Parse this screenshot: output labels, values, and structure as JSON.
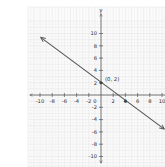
{
  "chart_data": {
    "type": "line",
    "title": "",
    "xlabel": "",
    "ylabel": "y",
    "xlim": [
      -10,
      10
    ],
    "ylim": [
      -10,
      10
    ],
    "grid": true,
    "x_ticks": [
      -10,
      -8,
      -6,
      -4,
      -2,
      0,
      2,
      4,
      6,
      8,
      10
    ],
    "x_tick_labels": [
      "-10",
      "-8",
      "-6",
      "-4",
      "-2",
      "0",
      "2",
      "4",
      "6",
      "8",
      "10"
    ],
    "y_ticks": [
      -10,
      -8,
      -6,
      -4,
      -2,
      2,
      4,
      6,
      8,
      10
    ],
    "y_tick_labels": [
      "-10",
      "-8",
      "-6",
      "-4",
      "-2",
      "2",
      "4",
      "6",
      "8",
      "10"
    ],
    "series": [
      {
        "name": "line",
        "x": [
          -10,
          10
        ],
        "y": [
          9.5,
          -5.5
        ],
        "arrows": "both"
      }
    ],
    "points": [
      {
        "x": 0,
        "y": 2,
        "label": "(0, 2)"
      },
      {
        "x": 4,
        "y": -1,
        "label": ""
      }
    ],
    "annotations": [
      "(0, 2)"
    ]
  },
  "labels": {
    "y_axis": "y",
    "origin": "0",
    "point_label": "(0, 2)"
  }
}
